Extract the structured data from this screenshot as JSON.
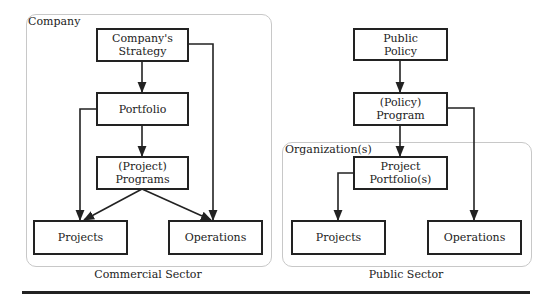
{
  "commercial": {
    "region_label": "Company",
    "caption": "Commercial Sector",
    "nodes": {
      "strategy": [
        "Company's",
        "Strategy"
      ],
      "portfolio": [
        "Portfolio"
      ],
      "programs": [
        "(Project)",
        "Programs"
      ],
      "projects": [
        "Projects"
      ],
      "operations": [
        "Operations"
      ]
    }
  },
  "public": {
    "region_label": "Organization(s)",
    "caption": "Public Sector",
    "nodes": {
      "policy": [
        "Public",
        "Policy"
      ],
      "program": [
        "(Policy)",
        "Program"
      ],
      "portfolios": [
        "Project",
        "Portfolio(s)"
      ],
      "projects": [
        "Projects"
      ],
      "operations": [
        "Operations"
      ]
    }
  },
  "colors": {
    "line": "#222222",
    "region_border": "#c8c8c8"
  }
}
